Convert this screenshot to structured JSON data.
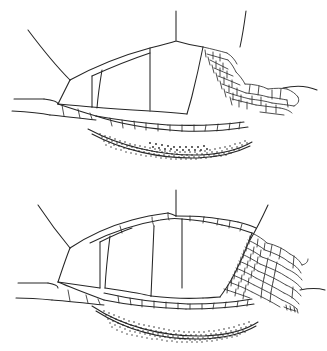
{
  "document": {
    "title": "Leaf midrib transverse section line drawings",
    "background_color": "#ffffff",
    "ink_color": "#262626",
    "figure_count": 2
  },
  "figures": [
    {
      "id": "figure-upper",
      "label": "Upper vascular bundle cross-section",
      "caption": "",
      "regions": [
        {
          "name": "epidermis-upper",
          "description": "single arched outer boundary line forming the upper surface"
        },
        {
          "name": "parenchyma-large-cells",
          "description": "four to five large angular ground-tissue cells filling the bundle interior"
        },
        {
          "name": "bundle-sheath-small-cells",
          "description": "cluster of small polygonal cells on the right flank"
        },
        {
          "name": "lower-cell-row",
          "description": "single row of small rectangular cells along the lower boundary"
        },
        {
          "name": "sclerenchyma-stippled-band",
          "description": "dense stippled crescent band beneath the lower cell row"
        },
        {
          "name": "lateral-extension-lines",
          "description": "free epidermal lines running off the left, top and right edges"
        }
      ]
    },
    {
      "id": "figure-lower",
      "label": "Lower vascular bundle cross-section",
      "caption": "",
      "regions": [
        {
          "name": "epidermis-upper",
          "description": "arched outer boundary with a row of small cells along the crest"
        },
        {
          "name": "parenchyma-large-cells",
          "description": "large angular ground-tissue cells filling the bundle interior"
        },
        {
          "name": "bundle-sheath-small-cells",
          "description": "dense cluster of small polygonal cells on the right flank"
        },
        {
          "name": "lower-cell-row",
          "description": "row of small cells along the lower boundary"
        },
        {
          "name": "sclerenchyma-stippled-band",
          "description": "dense stippled crescent band beneath the lower cell row"
        },
        {
          "name": "lateral-extension-lines",
          "description": "free epidermal lines running off the left, top and right edges"
        }
      ]
    }
  ],
  "annotations": {
    "text_labels": [],
    "scale_bar": null,
    "legend": null
  }
}
